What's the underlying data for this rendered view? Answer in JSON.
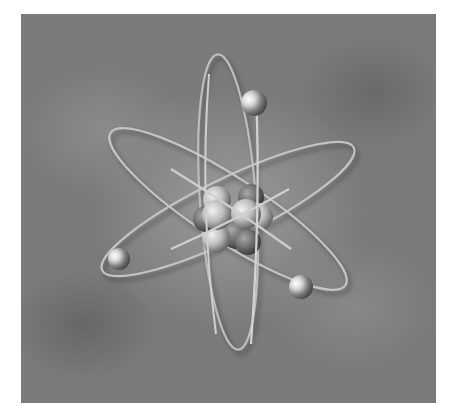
{
  "image": {
    "subject": "3D rendered atom model",
    "description": "Grayscale illustration of an atom with three elliptical electron orbits around a nucleus cluster of spheres",
    "orbits": 3,
    "electrons": 3,
    "nucleus_spheres": 9,
    "colors": {
      "background": "#7a7a7a",
      "background_glow": "#9a9a9a",
      "orbit_ring": "#d8d8d8",
      "electron": "#c8c8c8",
      "proton": "#b8b8b8",
      "neutron": "#6e6e6e"
    }
  }
}
